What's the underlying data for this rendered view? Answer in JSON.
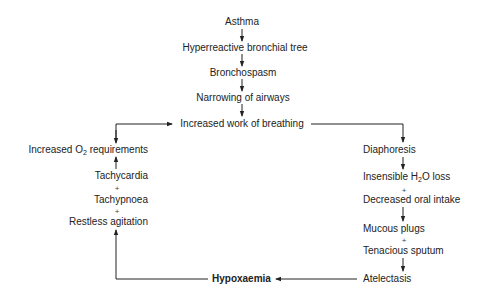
{
  "diagram": {
    "type": "flowchart",
    "title": "",
    "center_chain": [
      {
        "id": "asthma",
        "label": "Asthma"
      },
      {
        "id": "hyperreactive",
        "label": "Hyperreactive bronchial tree"
      },
      {
        "id": "bronchospasm",
        "label": "Bronchospasm"
      },
      {
        "id": "narrowing",
        "label": "Narrowing of airways"
      },
      {
        "id": "work",
        "label": "Increased work of breathing"
      }
    ],
    "left_column": {
      "o2_prefix": "Increased O",
      "o2_sub": "2",
      "o2_suffix": " requirements",
      "tachycardia": "Tachycardia",
      "plus1": "+",
      "tachypnoea": "Tachypnoea",
      "plus2": "+",
      "restless": "Restless agitation"
    },
    "right_column": {
      "diaphoresis": "Diaphoresis",
      "h2o_prefix": "Insensible H",
      "h2o_sub": "2",
      "h2o_suffix": "O loss",
      "plus1": "+",
      "oral": "Decreased oral intake",
      "mucous": "Mucous plugs",
      "plus2": "+",
      "sputum": "Tenacious sputum",
      "atelectasis": "Atelectasis"
    },
    "bottom": {
      "hypoxaemia": "Hypoxaemia"
    },
    "edges": [
      [
        "Asthma",
        "Hyperreactive bronchial tree"
      ],
      [
        "Hyperreactive bronchial tree",
        "Bronchospasm"
      ],
      [
        "Bronchospasm",
        "Narrowing of airways"
      ],
      [
        "Narrowing of airways",
        "Increased work of breathing"
      ],
      [
        "Increased work of breathing",
        "Diaphoresis"
      ],
      [
        "Diaphoresis",
        "Insensible H2O loss + Decreased oral intake"
      ],
      [
        "Decreased oral intake",
        "Mucous plugs + Tenacious sputum"
      ],
      [
        "Tenacious sputum",
        "Atelectasis"
      ],
      [
        "Atelectasis",
        "Hypoxaemia"
      ],
      [
        "Hypoxaemia",
        "Tachycardia + Tachypnoea + Restless agitation"
      ],
      [
        "Tachycardia",
        "Increased O2 requirements"
      ],
      [
        "Increased O2 requirements",
        "Increased work of breathing"
      ]
    ],
    "colors": {
      "text": "#222222",
      "lines": "#222222",
      "background": "#ffffff"
    }
  }
}
